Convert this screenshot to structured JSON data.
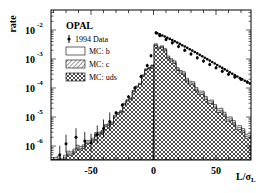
{
  "chart_data": {
    "type": "bar",
    "title": "",
    "xlabel": "L/σ_L",
    "ylabel": "rate",
    "yscale": "log",
    "xlim": [
      -82,
      78
    ],
    "ylim": [
      3e-07,
      0.03
    ],
    "x_ticks": [
      -50,
      0,
      50
    ],
    "y_ticks": [
      "10^-2",
      "10^-3",
      "10^-4",
      "10^-5",
      "10^-6"
    ],
    "grid": false,
    "legend_position": "upper-left",
    "legend_header": "OPAL",
    "legend": [
      {
        "label": "1994 Data",
        "style": "marker-errorbar"
      },
      {
        "label": "MC: b",
        "style": "open"
      },
      {
        "label": "MC: c",
        "style": "hatched"
      },
      {
        "label": "MC: uds",
        "style": "cross-hatched"
      }
    ],
    "series": [
      {
        "name": "1994 Data",
        "x": [
          -75,
          -70,
          -62,
          -55,
          -50,
          -45,
          -40,
          -35,
          -30,
          -25,
          -20,
          -15,
          -10,
          -5,
          -2,
          2,
          5,
          10,
          15,
          20,
          25,
          30,
          35,
          40,
          45,
          50,
          55,
          60,
          65,
          70,
          75
        ],
        "values": [
          5e-07,
          1.2e-06,
          2e-06,
          1.5e-06,
          1.3e-06,
          2.5e-06,
          4e-06,
          7e-06,
          1.4e-05,
          2.6e-05,
          5e-05,
          0.0001,
          0.00025,
          0.0006,
          0.0013,
          0.008,
          0.0065,
          0.0047,
          0.0036,
          0.0027,
          0.002,
          0.0015,
          0.0011,
          0.00085,
          0.00065,
          0.0005,
          0.00038,
          0.0003,
          0.00024,
          0.0002,
          0.00016
        ]
      },
      {
        "name": "MC: b (top of stack)",
        "x": [
          -75,
          -65,
          -55,
          -45,
          -35,
          -25,
          -15,
          -5,
          5,
          15,
          25,
          35,
          45,
          55,
          65,
          75
        ],
        "values": [
          4e-07,
          8e-07,
          1.3e-06,
          3e-06,
          7e-06,
          2.5e-05,
          0.0001,
          0.0006,
          0.003,
          0.0008,
          0.00025,
          9e-05,
          3.5e-05,
          1.5e-05,
          6e-06,
          2.5e-06
        ]
      },
      {
        "name": "MC: uds",
        "x": [
          -75,
          -65,
          -55,
          -45,
          -35,
          -25,
          -15,
          -5,
          5,
          15,
          25,
          35,
          45,
          55,
          65,
          75
        ],
        "values": [
          3e-07,
          6e-07,
          1e-06,
          2.5e-06,
          6e-06,
          2.2e-05,
          9e-05,
          0.00055,
          0.0026,
          0.00065,
          0.0002,
          7e-05,
          2.7e-05,
          1.1e-05,
          4.5e-06,
          1.8e-06
        ]
      }
    ]
  }
}
